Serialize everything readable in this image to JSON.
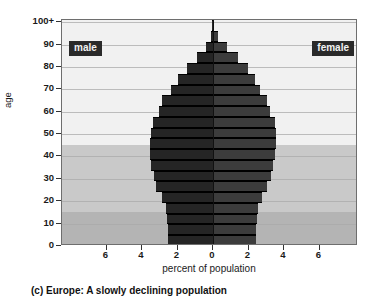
{
  "chart_data": {
    "type": "bar",
    "title": "Europe 2015",
    "subtype": "population-pyramid",
    "xlabel": "percent of population",
    "ylabel": "age",
    "caption": "(c) Europe: A slowly declining population",
    "legend": {
      "left_label": "male",
      "right_label": "female",
      "position": "inside-top-corners"
    },
    "grid": true,
    "xlim": [
      -7.6,
      7.6
    ],
    "xticks": [
      6,
      4,
      2,
      0,
      2,
      4,
      6
    ],
    "xtick_labels": [
      "6",
      "4",
      "2",
      "0",
      "2",
      "4",
      "6"
    ],
    "ylim": [
      0,
      101
    ],
    "yticks": [
      0,
      10,
      20,
      30,
      40,
      50,
      60,
      70,
      80,
      90,
      100
    ],
    "ytick_labels": [
      "0",
      "10",
      "20",
      "30",
      "40",
      "50",
      "60",
      "70",
      "80",
      "90",
      "100+"
    ],
    "categories": [
      "0-4",
      "5-9",
      "10-14",
      "15-19",
      "20-24",
      "25-29",
      "30-34",
      "35-39",
      "40-44",
      "45-49",
      "50-54",
      "55-59",
      "60-64",
      "65-69",
      "70-74",
      "75-79",
      "80-84",
      "85-89",
      "90-94",
      "95-99",
      "100+"
    ],
    "series": [
      {
        "name": "male",
        "color": "#252525",
        "side": "left",
        "values": [
          2.55,
          2.55,
          2.6,
          2.65,
          2.9,
          3.2,
          3.35,
          3.5,
          3.55,
          3.55,
          3.5,
          3.4,
          3.05,
          2.85,
          2.35,
          1.95,
          1.45,
          0.9,
          0.42,
          0.14,
          0.03
        ]
      },
      {
        "name": "female",
        "color": "#3c3c3c",
        "side": "right",
        "values": [
          2.45,
          2.45,
          2.5,
          2.55,
          2.75,
          3.05,
          3.25,
          3.4,
          3.5,
          3.55,
          3.55,
          3.5,
          3.2,
          3.05,
          2.65,
          2.35,
          1.95,
          1.4,
          0.78,
          0.3,
          0.07
        ]
      }
    ],
    "background_bands": [
      {
        "label": "older",
        "age_from": 45,
        "age_to": 101,
        "color": "#f1f1f1"
      },
      {
        "label": "working",
        "age_from": 15,
        "age_to": 45,
        "color": "#c9c9c9"
      },
      {
        "label": "youth",
        "age_from": 0,
        "age_to": 15,
        "color": "#b4b4b4"
      }
    ]
  },
  "colors": {
    "male_bar": "#252525",
    "female_bar": "#3c3c3c",
    "frame": "#6e6e6e",
    "gridline": "#a9a9a9",
    "tag_background": "#2a2a2a",
    "tag_text": "#f2f2f2"
  }
}
